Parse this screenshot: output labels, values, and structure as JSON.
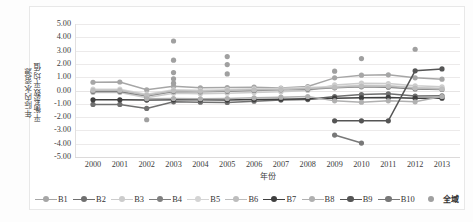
{
  "chart_data": {
    "type": "line",
    "title": "",
    "xlabel": "年份",
    "ylabel": "年际内水资源\n平衡系数平均值",
    "ylabel_line1": "年际内水资源",
    "ylabel_line2": "平衡系数平均值",
    "categories": [
      "2000",
      "2001",
      "2002",
      "2003",
      "2004",
      "2005",
      "2006",
      "2007",
      "2008",
      "2009",
      "2010",
      "2011",
      "2012",
      "2013"
    ],
    "x": [
      2000,
      2001,
      2002,
      2003,
      2004,
      2005,
      2006,
      2007,
      2008,
      2009,
      2010,
      2011,
      2012,
      2013
    ],
    "ylim": [
      -5.0,
      5.0
    ],
    "yticks": [
      "5.00",
      "4.00",
      "3.00",
      "2.00",
      "1.00",
      "0.00",
      "-1.00",
      "-2.00",
      "-3.00",
      "-4.00",
      "-5.00"
    ],
    "ytick_values": [
      5,
      4,
      3,
      2,
      1,
      0,
      -1,
      -2,
      -3,
      -4,
      -5
    ],
    "grid": true,
    "legend_position": "bottom",
    "series": [
      {
        "name": "B1",
        "color": "#a6a6a6",
        "marker": "circle",
        "x": [
          2000,
          2001,
          2002,
          2003,
          2004,
          2005,
          2006,
          2007,
          2008,
          2009,
          2010,
          2011,
          2012,
          2013
        ],
        "values": [
          0.62,
          0.64,
          0.05,
          0.32,
          0.2,
          0.22,
          0.25,
          0.18,
          0.3,
          0.95,
          1.15,
          1.18,
          0.95,
          0.85
        ]
      },
      {
        "name": "B2",
        "color": "#6f6f6f",
        "marker": "circle",
        "x": [
          2000,
          2001,
          2002,
          2003,
          2004,
          2005,
          2006,
          2007,
          2008,
          2009,
          2010,
          2011,
          2012,
          2013
        ],
        "values": [
          -1.05,
          -1.05,
          -1.35,
          -0.85,
          -0.88,
          -0.9,
          -0.8,
          -0.72,
          -0.68,
          -0.45,
          -0.3,
          -0.25,
          -0.42,
          -0.4
        ]
      },
      {
        "name": "B3",
        "color": "#cccccc",
        "marker": "circle",
        "x": [
          2000,
          2001,
          2002,
          2003,
          2004,
          2005,
          2006,
          2007,
          2008,
          2009,
          2010,
          2011,
          2012,
          2013
        ],
        "values": [
          -0.15,
          -0.15,
          -0.55,
          -0.2,
          -0.25,
          -0.2,
          -0.15,
          -0.1,
          0.0,
          0.42,
          0.55,
          0.52,
          0.35,
          0.28
        ]
      },
      {
        "name": "B4",
        "color": "#808080",
        "marker": "circle",
        "x": [
          2000,
          2001,
          2002,
          2003,
          2004,
          2005,
          2006,
          2007,
          2008,
          2009,
          2010,
          2011,
          2012,
          2013
        ],
        "values": [
          -0.08,
          -0.08,
          -0.42,
          -0.08,
          -0.1,
          -0.05,
          0.0,
          0.05,
          0.1,
          0.2,
          0.28,
          0.25,
          0.12,
          0.08
        ]
      },
      {
        "name": "B5",
        "color": "#d4d4d4",
        "marker": "circle",
        "x": [
          2000,
          2001,
          2002,
          2003,
          2004,
          2005,
          2006,
          2007,
          2008,
          2009,
          2010,
          2011,
          2012,
          2013
        ],
        "values": [
          0.1,
          0.1,
          -0.28,
          0.05,
          0.02,
          0.06,
          0.12,
          0.15,
          0.22,
          0.3,
          0.4,
          0.38,
          0.22,
          0.18
        ]
      },
      {
        "name": "B6",
        "color": "#bdbdbd",
        "marker": "circle",
        "x": [
          2000,
          2001,
          2002,
          2003,
          2004,
          2005,
          2006,
          2007,
          2008,
          2009,
          2010,
          2011,
          2012,
          2013
        ],
        "values": [
          0.02,
          0.02,
          -0.35,
          -0.02,
          -0.05,
          0.0,
          0.05,
          0.08,
          0.15,
          0.25,
          0.33,
          0.32,
          0.18,
          0.12
        ]
      },
      {
        "name": "B7",
        "color": "#3f3f3f",
        "marker": "circle",
        "x": [
          2000,
          2001,
          2002,
          2003,
          2004,
          2005,
          2006,
          2007,
          2008,
          2009,
          2010,
          2011,
          2012,
          2013
        ],
        "values": [
          -0.7,
          -0.7,
          -0.72,
          -0.7,
          -0.7,
          -0.72,
          -0.68,
          -0.65,
          -0.62,
          -0.58,
          -0.55,
          -0.52,
          -0.58,
          -0.58
        ]
      },
      {
        "name": "B8",
        "color": "#b0b0b0",
        "marker": "circle",
        "x": [
          2002,
          2003,
          2004,
          2005,
          2006,
          2007,
          2008,
          2009,
          2010,
          2011,
          2012,
          2013
        ],
        "values": [
          -0.62,
          -0.6,
          -0.62,
          -0.6,
          -0.55,
          -0.5,
          -0.45,
          -0.78,
          -0.88,
          -0.78,
          -0.85,
          -0.45
        ]
      },
      {
        "name": "B9",
        "color": "#555555",
        "marker": "circle",
        "x": [
          2009,
          2010,
          2011,
          2012,
          2013
        ],
        "values": [
          -2.28,
          -2.28,
          -2.28,
          1.48,
          1.62
        ]
      },
      {
        "name": "B10",
        "color": "#787878",
        "marker": "circle",
        "x": [
          2009,
          2010
        ],
        "values": [
          -3.35,
          -3.95
        ]
      },
      {
        "name": "全域",
        "color": "#a0a0a0",
        "marker": "circle",
        "line": false,
        "x": [
          2002,
          2003,
          2003,
          2003,
          2003,
          2003,
          2005,
          2005,
          2005,
          2009,
          2010,
          2012
        ],
        "values": [
          -2.2,
          3.72,
          2.28,
          1.35,
          0.88,
          0.55,
          2.55,
          1.95,
          1.25,
          1.45,
          2.4,
          3.1
        ]
      }
    ]
  },
  "legend": {
    "items": [
      {
        "label": "B1",
        "color": "#a6a6a6",
        "style": "line-marker"
      },
      {
        "label": "B2",
        "color": "#6f6f6f",
        "style": "line-marker"
      },
      {
        "label": "B3",
        "color": "#cccccc",
        "style": "line-marker"
      },
      {
        "label": "B4",
        "color": "#808080",
        "style": "line-marker"
      },
      {
        "label": "B5",
        "color": "#d4d4d4",
        "style": "line-marker"
      },
      {
        "label": "B6",
        "color": "#bdbdbd",
        "style": "line-marker"
      },
      {
        "label": "B7",
        "color": "#3f3f3f",
        "style": "line-marker"
      },
      {
        "label": "B8",
        "color": "#b0b0b0",
        "style": "line-marker"
      },
      {
        "label": "B9",
        "color": "#555555",
        "style": "line-marker"
      },
      {
        "label": "B10",
        "color": "#787878",
        "style": "line-marker"
      },
      {
        "label": "全域",
        "color": "#a0a0a0",
        "style": "marker-only"
      }
    ]
  }
}
